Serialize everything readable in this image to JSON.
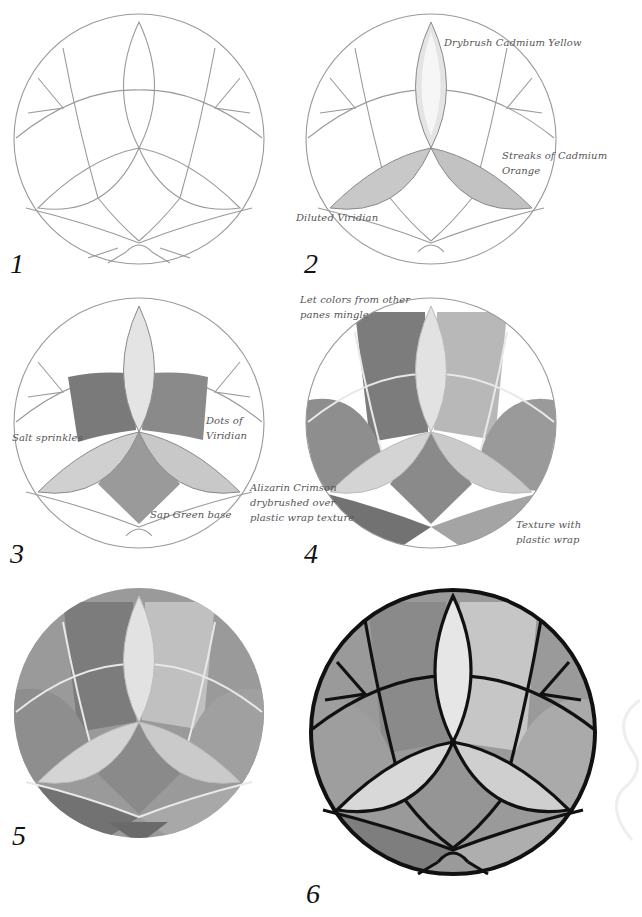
{
  "page": {
    "background": "#ffffff"
  },
  "steps": [
    {
      "number": "1",
      "notes": []
    },
    {
      "number": "2",
      "notes": [
        "Drybrush Cadmium Yellow",
        "Streaks of Cadmium Orange",
        "Diluted Viridian"
      ]
    },
    {
      "number": "3",
      "notes": [
        "Salt sprinkles",
        "Dots of\nViridian",
        "Sap Green base"
      ]
    },
    {
      "number": "4",
      "notes": [
        "Let colors from other\npanes mingle",
        "Alizarin Crimson\ndrybrushed over\nplastic wrap texture",
        "Texture with\nplastic wrap"
      ]
    },
    {
      "number": "5",
      "notes": []
    },
    {
      "number": "6",
      "notes": []
    }
  ],
  "colors": {
    "pencil": "#9a9a9a",
    "lead_came": "#111111",
    "paint_dark": "#6e6e6e",
    "paint_mid": "#9c9c9c",
    "paint_light": "#cfcfcf",
    "paint_highlight": "#ececec",
    "annotation": "#555555"
  }
}
